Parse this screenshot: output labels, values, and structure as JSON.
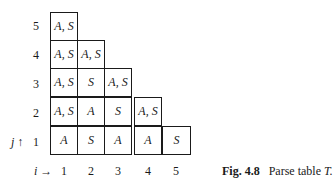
{
  "figure": {
    "caption_label": "Fig. 4.8",
    "caption_text": "Parse table",
    "caption_symbol": "T."
  },
  "axes": {
    "j_label": "j ↑",
    "i_label": "i →",
    "row_labels": [
      "5",
      "4",
      "3",
      "2",
      "1"
    ],
    "col_labels": [
      "1",
      "2",
      "3",
      "4",
      "5"
    ]
  },
  "table": {
    "rows": [
      {
        "j": "5",
        "cells": [
          "A, S"
        ]
      },
      {
        "j": "4",
        "cells": [
          "A, S",
          "A, S"
        ]
      },
      {
        "j": "3",
        "cells": [
          "A, S",
          "S",
          "A, S"
        ]
      },
      {
        "j": "2",
        "cells": [
          "A, S",
          "A",
          "S",
          "A, S"
        ]
      },
      {
        "j": "1",
        "cells": [
          "A",
          "S",
          "A",
          "A",
          "S"
        ]
      }
    ]
  }
}
